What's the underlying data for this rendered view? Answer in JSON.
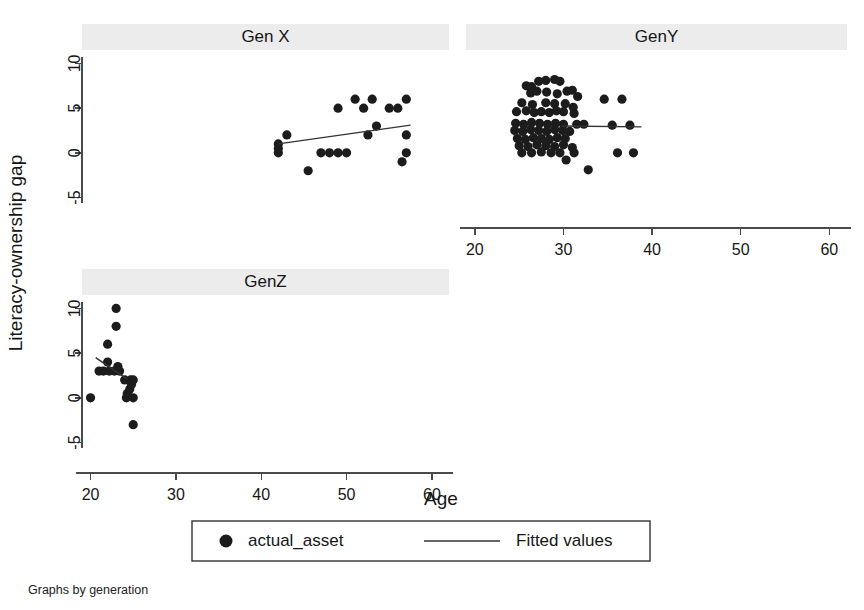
{
  "figure": {
    "caption": "Graphs by generation",
    "xlabel": "Age",
    "ylabel": "Literacy-ownership gap"
  },
  "legend": {
    "marker_label": "actual_asset",
    "line_label": "Fitted values"
  },
  "chart_data": {
    "type": "scatter",
    "title": "",
    "xlabel": "Age",
    "ylabel": "Literacy-ownership gap",
    "xlim": [
      19,
      62
    ],
    "ylim": [
      -6.5,
      11.5
    ],
    "xticks": [
      20,
      30,
      40,
      50,
      60
    ],
    "yticks": [
      -5,
      0,
      5,
      10
    ],
    "grid": false,
    "legend_position": "bottom-center",
    "legend_entries": [
      "actual_asset",
      "Fitted values"
    ],
    "facet_by": "generation",
    "panels": [
      {
        "name": "Gen X",
        "row": 0,
        "col": 0,
        "show_x_axis": false,
        "show_y_axis": true,
        "points": [
          {
            "x": 42.0,
            "y": 1.0
          },
          {
            "x": 42.0,
            "y": 0.5
          },
          {
            "x": 42.0,
            "y": 0.0
          },
          {
            "x": 43.0,
            "y": 2.0
          },
          {
            "x": 45.5,
            "y": -2.0
          },
          {
            "x": 47.0,
            "y": 0.0
          },
          {
            "x": 48.0,
            "y": 0.0
          },
          {
            "x": 49.0,
            "y": 0.0
          },
          {
            "x": 50.0,
            "y": 0.0
          },
          {
            "x": 49.0,
            "y": 5.0
          },
          {
            "x": 51.0,
            "y": 6.0
          },
          {
            "x": 52.0,
            "y": 5.0
          },
          {
            "x": 53.0,
            "y": 6.0
          },
          {
            "x": 52.5,
            "y": 2.0
          },
          {
            "x": 53.5,
            "y": 3.0
          },
          {
            "x": 55.0,
            "y": 5.0
          },
          {
            "x": 56.0,
            "y": 5.0
          },
          {
            "x": 57.0,
            "y": 6.0
          },
          {
            "x": 57.0,
            "y": 2.0
          },
          {
            "x": 57.0,
            "y": 0.0
          },
          {
            "x": 56.5,
            "y": -1.0
          }
        ],
        "fit_line": {
          "x0": 42.0,
          "y0": 1.0,
          "x1": 57.5,
          "y1": 3.1
        }
      },
      {
        "name": "GenY",
        "row": 0,
        "col": 1,
        "show_x_axis": true,
        "show_y_axis": false,
        "points": [
          {
            "x": 25.8,
            "y": 7.5
          },
          {
            "x": 26.4,
            "y": 7.4
          },
          {
            "x": 27.2,
            "y": 8.0
          },
          {
            "x": 28.0,
            "y": 8.1
          },
          {
            "x": 29.0,
            "y": 8.2
          },
          {
            "x": 29.6,
            "y": 8.0
          },
          {
            "x": 26.3,
            "y": 6.7
          },
          {
            "x": 27.0,
            "y": 6.9
          },
          {
            "x": 28.1,
            "y": 6.8
          },
          {
            "x": 29.3,
            "y": 6.6
          },
          {
            "x": 30.4,
            "y": 6.9
          },
          {
            "x": 31.0,
            "y": 7.0
          },
          {
            "x": 31.6,
            "y": 6.3
          },
          {
            "x": 34.6,
            "y": 6.0
          },
          {
            "x": 36.6,
            "y": 6.0
          },
          {
            "x": 25.3,
            "y": 5.6
          },
          {
            "x": 26.5,
            "y": 5.4
          },
          {
            "x": 28.0,
            "y": 5.6
          },
          {
            "x": 29.0,
            "y": 5.5
          },
          {
            "x": 30.2,
            "y": 5.5
          },
          {
            "x": 31.1,
            "y": 5.1
          },
          {
            "x": 24.7,
            "y": 4.6
          },
          {
            "x": 25.8,
            "y": 4.7
          },
          {
            "x": 26.7,
            "y": 4.5
          },
          {
            "x": 27.5,
            "y": 4.6
          },
          {
            "x": 28.4,
            "y": 4.5
          },
          {
            "x": 29.2,
            "y": 4.7
          },
          {
            "x": 30.0,
            "y": 4.6
          },
          {
            "x": 31.2,
            "y": 4.4
          },
          {
            "x": 24.6,
            "y": 3.3
          },
          {
            "x": 25.5,
            "y": 3.2
          },
          {
            "x": 26.4,
            "y": 3.4
          },
          {
            "x": 27.3,
            "y": 3.3
          },
          {
            "x": 28.2,
            "y": 3.2
          },
          {
            "x": 29.1,
            "y": 3.3
          },
          {
            "x": 30.0,
            "y": 3.2
          },
          {
            "x": 31.5,
            "y": 3.2
          },
          {
            "x": 32.3,
            "y": 3.2
          },
          {
            "x": 35.5,
            "y": 3.1
          },
          {
            "x": 37.5,
            "y": 3.1
          },
          {
            "x": 24.5,
            "y": 2.5
          },
          {
            "x": 25.4,
            "y": 2.4
          },
          {
            "x": 26.3,
            "y": 2.6
          },
          {
            "x": 27.2,
            "y": 2.5
          },
          {
            "x": 28.1,
            "y": 2.4
          },
          {
            "x": 29.0,
            "y": 2.6
          },
          {
            "x": 29.9,
            "y": 2.5
          },
          {
            "x": 30.7,
            "y": 2.4
          },
          {
            "x": 24.8,
            "y": 1.6
          },
          {
            "x": 25.7,
            "y": 1.5
          },
          {
            "x": 26.6,
            "y": 1.7
          },
          {
            "x": 27.5,
            "y": 1.6
          },
          {
            "x": 28.4,
            "y": 1.5
          },
          {
            "x": 29.3,
            "y": 1.7
          },
          {
            "x": 30.2,
            "y": 1.6
          },
          {
            "x": 25.0,
            "y": 0.8
          },
          {
            "x": 26.0,
            "y": 0.7
          },
          {
            "x": 27.0,
            "y": 0.9
          },
          {
            "x": 28.0,
            "y": 0.8
          },
          {
            "x": 29.0,
            "y": 0.7
          },
          {
            "x": 30.0,
            "y": 0.9
          },
          {
            "x": 31.0,
            "y": 0.6
          },
          {
            "x": 25.3,
            "y": 0.0
          },
          {
            "x": 26.4,
            "y": 0.0
          },
          {
            "x": 27.5,
            "y": 0.1
          },
          {
            "x": 28.6,
            "y": 0.0
          },
          {
            "x": 29.6,
            "y": 0.0
          },
          {
            "x": 31.2,
            "y": 0.0
          },
          {
            "x": 36.1,
            "y": 0.0
          },
          {
            "x": 37.9,
            "y": 0.0
          },
          {
            "x": 30.3,
            "y": -0.8
          },
          {
            "x": 32.8,
            "y": -1.9
          }
        ],
        "fit_line": {
          "x0": 29.8,
          "y0": 3.0,
          "x1": 38.8,
          "y1": 2.9
        }
      },
      {
        "name": "GenZ",
        "row": 1,
        "col": 0,
        "show_x_axis": true,
        "show_y_axis": true,
        "points": [
          {
            "x": 20.0,
            "y": 0.0
          },
          {
            "x": 21.0,
            "y": 3.0
          },
          {
            "x": 21.5,
            "y": 3.0
          },
          {
            "x": 22.0,
            "y": 6.0
          },
          {
            "x": 22.0,
            "y": 4.0
          },
          {
            "x": 22.2,
            "y": 3.0
          },
          {
            "x": 22.8,
            "y": 3.0
          },
          {
            "x": 23.0,
            "y": 10.0
          },
          {
            "x": 23.0,
            "y": 8.0
          },
          {
            "x": 23.2,
            "y": 3.5
          },
          {
            "x": 23.4,
            "y": 3.0
          },
          {
            "x": 24.0,
            "y": 2.0
          },
          {
            "x": 24.2,
            "y": 0.0
          },
          {
            "x": 24.3,
            "y": 0.5
          },
          {
            "x": 24.6,
            "y": 1.0
          },
          {
            "x": 24.7,
            "y": 2.0
          },
          {
            "x": 24.8,
            "y": 1.5
          },
          {
            "x": 25.0,
            "y": 0.0
          },
          {
            "x": 25.0,
            "y": 2.0
          },
          {
            "x": 25.0,
            "y": -3.0
          }
        ],
        "fit_line": {
          "x0": 20.6,
          "y0": 4.5,
          "x1": 24.3,
          "y1": 2.1
        }
      }
    ]
  }
}
